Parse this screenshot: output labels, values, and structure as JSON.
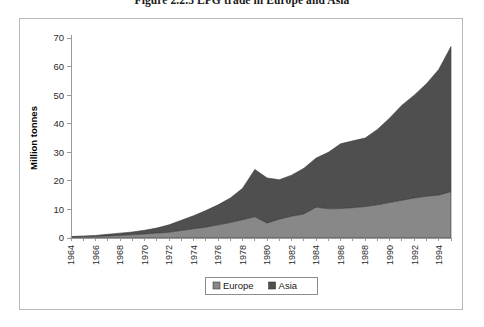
{
  "figure": {
    "title": "Figure 2.2.3   LPG trade in Europe and Asia"
  },
  "chart_data": {
    "type": "area",
    "stacked": true,
    "title": "Figure 2.2.3   LPG trade in Europe and Asia",
    "xlabel": "",
    "ylabel": "Million tonnes",
    "ylim": [
      0,
      70
    ],
    "ytick_step": 10,
    "yticks": [
      0,
      10,
      20,
      30,
      40,
      50,
      60,
      70
    ],
    "xlim": [
      1964,
      1995
    ],
    "grid": false,
    "legend_position": "bottom-center",
    "legend": [
      "Europe",
      "Asia"
    ],
    "colors": {
      "Europe": "#888888",
      "Asia": "#4f4f4f",
      "outline": "#3a3a3a",
      "axis": "#9a9a9a",
      "frame": "#b9b9b9",
      "text": "#1a1a1a"
    },
    "x": [
      1964,
      1965,
      1966,
      1967,
      1968,
      1969,
      1970,
      1971,
      1972,
      1973,
      1974,
      1975,
      1976,
      1977,
      1978,
      1979,
      1980,
      1981,
      1982,
      1983,
      1984,
      1985,
      1986,
      1987,
      1988,
      1989,
      1990,
      1991,
      1992,
      1993,
      1994,
      1995
    ],
    "xtick_labels": [
      "1964",
      "1966",
      "1968",
      "1970",
      "1972",
      "1974",
      "1976",
      "1978",
      "1980",
      "1982",
      "1984",
      "1986",
      "1988",
      "1990",
      "1992",
      "1994"
    ],
    "xtick_values": [
      1964,
      1966,
      1968,
      1970,
      1972,
      1974,
      1976,
      1978,
      1980,
      1982,
      1984,
      1986,
      1988,
      1990,
      1992,
      1994
    ],
    "series": [
      {
        "name": "Europe",
        "values": [
          0.3,
          0.4,
          0.5,
          0.7,
          0.9,
          1.1,
          1.4,
          1.7,
          2.0,
          2.6,
          3.2,
          3.8,
          4.6,
          5.4,
          6.4,
          7.4,
          5.2,
          6.6,
          7.6,
          8.4,
          10.8,
          10.2,
          10.3,
          10.6,
          11.0,
          11.6,
          12.4,
          13.2,
          14.0,
          14.6,
          15.0,
          16.2
        ]
      },
      {
        "name": "Asia",
        "values": [
          0.2,
          0.3,
          0.4,
          0.6,
          0.8,
          1.0,
          1.3,
          1.8,
          2.6,
          3.6,
          4.6,
          5.8,
          7.0,
          8.6,
          11.0,
          16.6,
          15.8,
          13.8,
          14.4,
          16.0,
          17.2,
          19.8,
          22.7,
          23.4,
          24.0,
          26.4,
          29.6,
          33.3,
          36.0,
          39.4,
          44.0,
          50.8
        ]
      }
    ],
    "totals": [
      0.5,
      0.7,
      0.9,
      1.3,
      1.7,
      2.1,
      2.7,
      3.5,
      4.6,
      6.2,
      7.8,
      9.6,
      11.6,
      14.0,
      17.4,
      24.0,
      21.0,
      20.4,
      22.0,
      24.4,
      28.0,
      30.0,
      33.0,
      34.0,
      35.0,
      38.0,
      42.0,
      46.5,
      50.0,
      54.0,
      59.0,
      67.0
    ]
  }
}
